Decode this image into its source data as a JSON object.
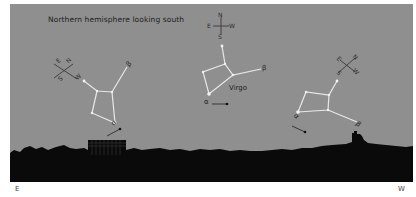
{
  "title": "Northern hemisphere looking south",
  "constellation_name": "Virgo",
  "star_labels": {
    "alpha": "α",
    "beta": "β"
  },
  "compass": {
    "n": "N",
    "e": "E",
    "s": "S",
    "w": "W"
  },
  "horizon_directions": {
    "left": "E",
    "right": "W"
  },
  "colors": {
    "sky": "#8f8f8f",
    "ground": "#0a0a0a",
    "lines": "#e8e8e8",
    "text": "#1e1e1e"
  },
  "panels": [
    {
      "position": "rising-east",
      "compass_rotation_deg": -45
    },
    {
      "position": "due-south",
      "compass_rotation_deg": 0
    },
    {
      "position": "setting-west",
      "compass_rotation_deg": 45
    }
  ]
}
